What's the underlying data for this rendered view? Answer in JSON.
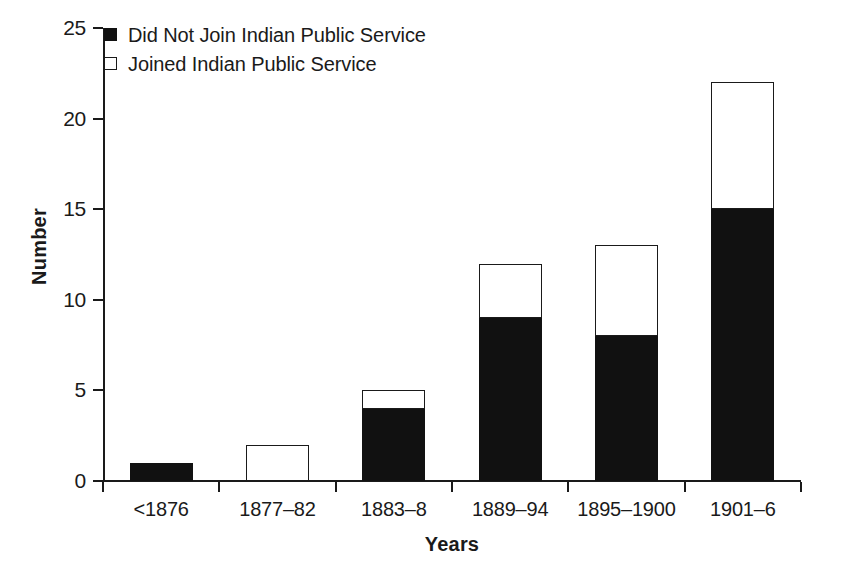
{
  "chart_data": {
    "type": "bar",
    "subtype": "stacked-bar",
    "title": "",
    "xlabel": "Years",
    "ylabel": "Number",
    "categories": [
      "<1876",
      "1877–82",
      "1883–8",
      "1889–94",
      "1895–1900",
      "1901–6"
    ],
    "series": [
      {
        "name": "Did Not Join Indian Public Service",
        "marker": "filled-square",
        "color": "#111111",
        "values": [
          1,
          0,
          4,
          9,
          8,
          15
        ]
      },
      {
        "name": "Joined Indian Public Service",
        "marker": "open-square",
        "color": "#ffffff",
        "values": [
          0,
          2,
          1,
          3,
          5,
          7
        ]
      }
    ],
    "totals": [
      1,
      2,
      5,
      12,
      13,
      22
    ],
    "ylim": [
      0,
      25
    ],
    "yticks": [
      0,
      5,
      10,
      15,
      20,
      25
    ],
    "ytick_labels": [
      "0",
      "5",
      "10",
      "15",
      "20",
      "25"
    ],
    "grid": false,
    "legend_position": "top-left"
  },
  "legend": {
    "items": [
      {
        "label": "Did Not Join Indian Public Service",
        "marker": "filled-square"
      },
      {
        "label": "Joined Indian Public Service",
        "marker": "open-square"
      }
    ]
  },
  "axes": {
    "y_title": "Number",
    "x_title": "Years"
  }
}
